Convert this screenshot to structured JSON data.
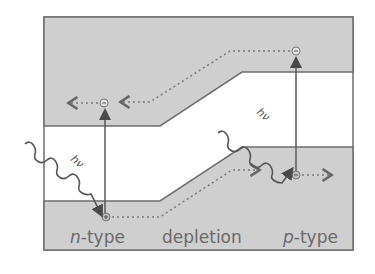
{
  "diagram": {
    "title": "",
    "colors": {
      "band_fill": "#cfcfcf",
      "band_stroke": "#6e6e6e",
      "gap_fill": "#ffffff",
      "arrow": "#5a5a5a",
      "dotted": "#7a7a7a",
      "text": "#6a6a6a"
    },
    "regions": [
      {
        "id": "n",
        "label_italic": "n",
        "label_rest": "-type"
      },
      {
        "id": "depletion",
        "label": "depletion"
      },
      {
        "id": "p",
        "label_italic": "p",
        "label_rest": "-type"
      }
    ],
    "photons": [
      {
        "id": "photon-left",
        "label": "hν"
      },
      {
        "id": "photon-right",
        "label": "hν"
      }
    ],
    "carriers": {
      "electron_symbol": "−",
      "hole_symbol": "+"
    },
    "bands": {
      "conduction": "conduction band",
      "valence": "valence band"
    }
  }
}
